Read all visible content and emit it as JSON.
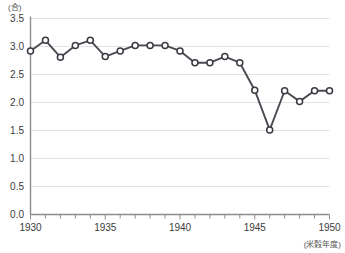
{
  "chart_data": {
    "type": "line",
    "title": "",
    "subtitle": "",
    "xlabel": "(米穀年度)",
    "ylabel": "(合)",
    "x": [
      1930,
      1931,
      1932,
      1933,
      1934,
      1935,
      1936,
      1937,
      1938,
      1939,
      1940,
      1941,
      1942,
      1943,
      1944,
      1945,
      1946,
      1947,
      1948,
      1949,
      1950
    ],
    "values": [
      2.92,
      3.11,
      2.81,
      3.02,
      3.11,
      2.82,
      2.92,
      3.02,
      3.02,
      3.02,
      2.92,
      2.71,
      2.71,
      2.82,
      2.71,
      2.22,
      1.51,
      2.21,
      2.02,
      2.21,
      2.21
    ],
    "series": [
      {
        "name": "一人一日当たり米消費量",
        "values": [
          2.92,
          3.11,
          2.81,
          3.02,
          3.11,
          2.82,
          2.92,
          3.02,
          3.02,
          3.02,
          2.92,
          2.71,
          2.71,
          2.82,
          2.71,
          2.22,
          1.51,
          2.21,
          2.02,
          2.21,
          2.21
        ]
      }
    ],
    "xlim": [
      1930,
      1950
    ],
    "ylim": [
      0.0,
      3.5
    ],
    "ytick_labels": [
      "3.5",
      "3.0",
      "2.5",
      "2.0",
      "1.5",
      "1.0",
      "0.5",
      "0.0"
    ],
    "ytick_values": [
      3.5,
      3.0,
      2.5,
      2.0,
      1.5,
      1.0,
      0.5,
      0.0
    ],
    "xtick_labels": [
      "1930",
      "1935",
      "1940",
      "1945",
      "1950"
    ],
    "xtick_values": [
      1930,
      1935,
      1940,
      1945,
      1950
    ],
    "xminor_step": 1,
    "grid": true,
    "grid_axis": "y",
    "legend": "none",
    "marker": "open-circle",
    "colors": {
      "line": "#4a4a52",
      "marker_fill": "#ffffff",
      "marker_stroke": "#3a3a42",
      "grid": "#e2e2e2",
      "axis": "#8d8d8d",
      "text": "#3b3b3b",
      "background": "#ffffff"
    }
  }
}
